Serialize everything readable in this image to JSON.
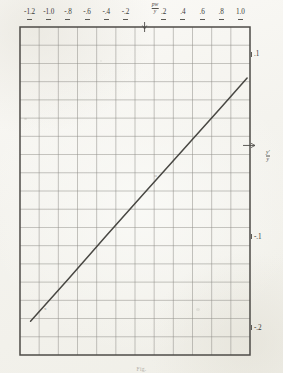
{
  "figure": {
    "kind": "graph-paper-line-plot",
    "caption": "Fig.",
    "paper_color": "#f4f3ee",
    "grid_color": "#8e8c86",
    "frame_color": "#4d4b47",
    "curve_color": "#3a3834"
  },
  "axes": {
    "top": {
      "labels": [
        "-1.2",
        "-1.0",
        "-.8",
        "-.6",
        "-.4",
        "-.2",
        ".2",
        ".4",
        ".6",
        ".8",
        "1.0"
      ],
      "origin_label": {
        "numerator": "pw",
        "denominator": "y"
      },
      "values": [
        -1.2,
        -1.0,
        -0.8,
        -0.6,
        -0.4,
        -0.2,
        0.2,
        0.4,
        0.6,
        0.8,
        1.0
      ],
      "range": [
        -1.3,
        1.1
      ]
    },
    "right": {
      "labels": [
        ".1",
        "-.1",
        "-.2"
      ],
      "values": [
        0.1,
        -0.1,
        -0.2
      ],
      "origin_label": {
        "numerator": "y'",
        "denominator": "y"
      },
      "range": [
        -0.23,
        0.13
      ]
    }
  },
  "chart_data": {
    "type": "line",
    "title": "",
    "xlabel": "pw/y",
    "ylabel": "y'/y",
    "xlim": [
      -1.3,
      1.1
    ],
    "ylim": [
      -0.23,
      0.13
    ],
    "grid": true,
    "legend": "none",
    "xtick_labels": [
      "-1.2",
      "-1.0",
      "-.8",
      "-.6",
      "-.4",
      "-.2",
      ".2",
      ".4",
      ".6",
      ".8",
      "1.0"
    ],
    "xticks": [
      -1.2,
      -1.0,
      -0.8,
      -0.6,
      -0.4,
      -0.2,
      0.2,
      0.4,
      0.6,
      0.8,
      1.0
    ],
    "ytick_labels": [
      ".1",
      "-.1",
      "-.2"
    ],
    "yticks": [
      0.1,
      -0.1,
      -0.2
    ],
    "series": [
      {
        "name": "linear relation",
        "style": "solid-straight",
        "x": [
          -1.19,
          -0.8,
          -0.4,
          0.0,
          0.4,
          0.8,
          1.07
        ],
        "y": [
          -0.193,
          -0.147,
          -0.099,
          -0.052,
          -0.005,
          0.042,
          0.074
        ]
      }
    ],
    "annotations": [
      {
        "text": "x",
        "x": -1.05,
        "y": -0.181
      },
      {
        "text": "o",
        "x": 0.1,
        "y": -0.035
      },
      {
        "text": "·",
        "x": -0.55,
        "y": -0.115
      }
    ]
  },
  "grid": {
    "columns": 12,
    "rows": 18,
    "cell_px": 19.1
  }
}
